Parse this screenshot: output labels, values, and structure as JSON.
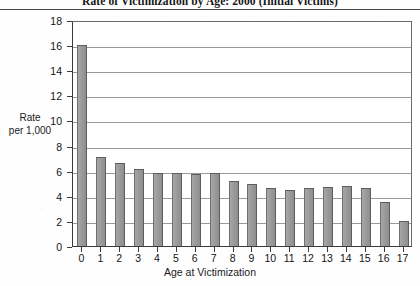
{
  "chart_data": {
    "type": "bar",
    "title": "Rate of Victimization by Age: 2000 (Initial Victims)",
    "xlabel": "Age at Victimization",
    "ylabel": "Rate per 1,000",
    "ylabel_lines": [
      "Rate",
      "per 1,000"
    ],
    "categories": [
      "0",
      "1",
      "2",
      "3",
      "4",
      "5",
      "6",
      "7",
      "8",
      "9",
      "10",
      "11",
      "12",
      "13",
      "14",
      "15",
      "16",
      "17"
    ],
    "values": [
      16.0,
      7.1,
      6.6,
      6.1,
      5.8,
      5.8,
      5.7,
      5.8,
      5.2,
      4.9,
      4.6,
      4.5,
      4.6,
      4.7,
      4.8,
      4.6,
      3.5,
      2.0
    ],
    "ylim": [
      0,
      18
    ],
    "yticks": [
      0,
      2,
      4,
      6,
      8,
      10,
      12,
      14,
      16,
      18
    ],
    "ytick_labels": [
      "0",
      "2",
      "4",
      "6",
      "8",
      "10",
      "12",
      "14",
      "16",
      "18"
    ],
    "grid": true,
    "grid_axis": "y",
    "legend": null,
    "bar_color": "#9a9a9a",
    "bar_edge_color": "#5d5d5d",
    "axis_color": "#3a3a3a",
    "grid_color": "#9a9a9a",
    "background_color": "#ffffff"
  }
}
